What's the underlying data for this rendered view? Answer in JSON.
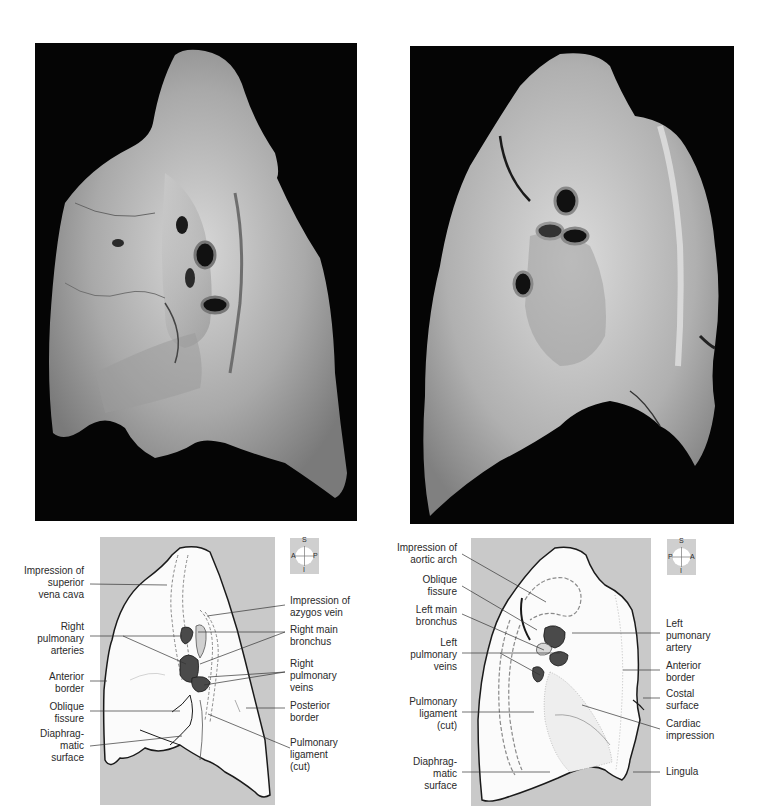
{
  "figure": {
    "left_view": {
      "name": "Right lung, medial view",
      "photo": {
        "background": "#050505",
        "tissue_color": "#b8b8b8"
      },
      "compass": {
        "top": "S",
        "bottom": "I",
        "left": "A",
        "right": "P"
      },
      "labels_left": [
        {
          "text": "Impression of\nsuperior\nvena cava"
        },
        {
          "text": "Right\npulmonary\narteries"
        },
        {
          "text": "Anterior\nborder"
        },
        {
          "text": "Oblique\nfissure"
        },
        {
          "text": "Diaphrag-\nmatic\nsurface"
        }
      ],
      "labels_right": [
        {
          "text": "Impression of\nazygos vein"
        },
        {
          "text": "Right main\nbronchus"
        },
        {
          "text": "Right\npulmonary\nveins"
        },
        {
          "text": "Posterior\nborder"
        },
        {
          "text": "Pulmonary\nligament\n(cut)"
        }
      ]
    },
    "right_view": {
      "name": "Left lung, medial view",
      "photo": {
        "background": "#050505",
        "tissue_color": "#c0c0c0"
      },
      "compass": {
        "top": "S",
        "bottom": "I",
        "left": "P",
        "right": "A"
      },
      "labels_left": [
        {
          "text": "Impression of\naortic arch"
        },
        {
          "text": "Oblique\nfissure"
        },
        {
          "text": "Left main\nbronchus"
        },
        {
          "text": "Left\npulmonary\nveins"
        },
        {
          "text": "Pulmonary\nligament\n(cut)"
        },
        {
          "text": "Diaphrag-\nmatic\nsurface"
        }
      ],
      "labels_right": [
        {
          "text": "Left\npumonary\nartery"
        },
        {
          "text": "Anterior\nborder"
        },
        {
          "text": "Costal\nsurface"
        },
        {
          "text": "Cardiac\nimpression"
        },
        {
          "text": "Lingula"
        }
      ]
    },
    "colors": {
      "panel_gray": "#c9c9c9",
      "lung_fill": "#fbfbfb",
      "outline": "#1a1a1a",
      "vessel_dark": "#4a4a4a",
      "dashed_line": "#8a8a8a"
    }
  }
}
